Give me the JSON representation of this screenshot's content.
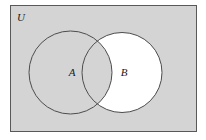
{
  "figure": {
    "type": "venn-diagram",
    "caption_text": "",
    "canvas": {
      "width": 206,
      "height": 140,
      "background": "#ffffff"
    }
  },
  "universe": {
    "label": "U",
    "label_x": 21,
    "label_y": 21,
    "label_font_size": 11,
    "rect": {
      "x": 10,
      "y": 5,
      "width": 187,
      "height": 127
    },
    "fill": "#d4d4d4",
    "stroke": "#595959",
    "stroke_width": 1
  },
  "sets": [
    {
      "id": "A",
      "label": "A",
      "label_x": 72,
      "label_y": 76,
      "label_font_size": 11,
      "cx": 70.5,
      "cy": 72.5,
      "r": 41.5,
      "fill": "#d4d4d4",
      "stroke": "#4d4d4d",
      "stroke_width": 1,
      "shaded": true
    },
    {
      "id": "B",
      "label": "B",
      "label_x": 124,
      "label_y": 76,
      "label_font_size": 11,
      "cx": 122,
      "cy": 72.5,
      "r": 40,
      "fill": "#ffffff",
      "stroke": "#4d4d4d",
      "stroke_width": 1,
      "shaded": false
    }
  ],
  "regions": {
    "intersection_fill": "#d4d4d4",
    "b_only_fill": "#ffffff",
    "a_only_fill": "#d4d4d4",
    "outside_fill": "#d4d4d4"
  },
  "colors": {
    "shade_gray": "#d4d4d4",
    "white": "#ffffff",
    "circle_stroke": "#4d4d4d",
    "rect_stroke": "#595959",
    "text": "#1a1a1a"
  }
}
